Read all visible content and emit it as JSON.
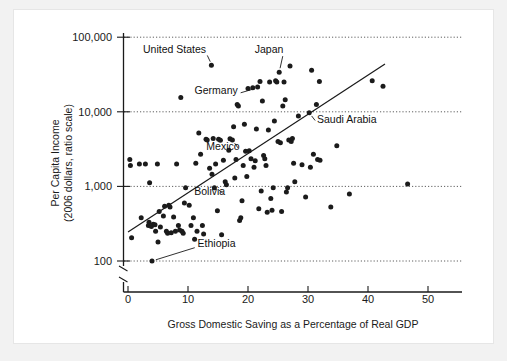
{
  "chart_data": {
    "type": "scatter",
    "title": "",
    "xlabel": "Gross Domestic Saving as a Percentage of Real GDP",
    "ylabel_line1": "Per Capita Income",
    "ylabel_line2": "(2006 dollars, ratio scale)",
    "yscale": "log",
    "xscale": "linear",
    "xlim": [
      0,
      56
    ],
    "ylim": [
      100,
      100000
    ],
    "grid": "horizontal-dotted-at-decades",
    "legend": "none",
    "axis_break": true,
    "xticks": [
      0,
      10,
      20,
      30,
      40,
      50
    ],
    "xtick_labels": [
      "0",
      "10",
      "20",
      "30",
      "40",
      "50"
    ],
    "yticks": [
      100,
      1000,
      10000,
      100000
    ],
    "ytick_labels": [
      "100",
      "1,000",
      "10,000",
      "100,000"
    ],
    "trend_line": {
      "x_start": 0.0,
      "y_start": 320,
      "x_end": 42.8,
      "y_end": 46000
    },
    "annotations": [
      {
        "label": "United States",
        "text_x": 13.0,
        "text_y": 62000,
        "point_x": 14.0,
        "point_y": 42000
      },
      {
        "label": "Japan",
        "text_x": 25.9,
        "text_y": 61000,
        "point_x": 25.2,
        "point_y": 34000
      },
      {
        "label": "Germany",
        "text_x": 18.3,
        "text_y": 17500,
        "point_x": 21.6,
        "point_y": 21000
      },
      {
        "label": "Mexico",
        "text_x": 18.6,
        "text_y": 3050,
        "point_x": 17.4,
        "point_y": 4200
      },
      {
        "label": "Saudi Arabia",
        "text_x": 31.5,
        "text_y": 7100,
        "point_x": 30.2,
        "point_y": 9700
      },
      {
        "label": "Bolivia",
        "text_x": 16.2,
        "text_y": 770,
        "point_x": 14.6,
        "point_y": 960
      },
      {
        "label": "Ethiopia",
        "text_x": 11.6,
        "text_y": 155,
        "point_x": 4.0,
        "point_y": 100
      }
    ],
    "points": [
      [
        0.3,
        2300
      ],
      [
        0.4,
        1900
      ],
      [
        0.6,
        205
      ],
      [
        1.9,
        2000
      ],
      [
        2.2,
        380
      ],
      [
        2.9,
        2000
      ],
      [
        3.4,
        300
      ],
      [
        3.5,
        330
      ],
      [
        3.6,
        1120
      ],
      [
        3.9,
        290
      ],
      [
        4.0,
        100
      ],
      [
        4.2,
        310
      ],
      [
        4.5,
        305
      ],
      [
        4.6,
        250
      ],
      [
        4.9,
        2000
      ],
      [
        5.0,
        180
      ],
      [
        5.2,
        460
      ],
      [
        5.4,
        285
      ],
      [
        5.9,
        400
      ],
      [
        6.1,
        540
      ],
      [
        6.4,
        250
      ],
      [
        6.6,
        235
      ],
      [
        6.8,
        560
      ],
      [
        7.0,
        530
      ],
      [
        7.2,
        240
      ],
      [
        7.6,
        390
      ],
      [
        7.9,
        250
      ],
      [
        8.1,
        2000
      ],
      [
        8.4,
        300
      ],
      [
        8.6,
        260
      ],
      [
        8.8,
        15500
      ],
      [
        9.0,
        250
      ],
      [
        9.2,
        235
      ],
      [
        9.4,
        600
      ],
      [
        9.6,
        960
      ],
      [
        10.2,
        560
      ],
      [
        10.5,
        300
      ],
      [
        10.9,
        380
      ],
      [
        11.1,
        195
      ],
      [
        11.3,
        2050
      ],
      [
        11.5,
        250
      ],
      [
        11.8,
        5200
      ],
      [
        12.1,
        2700
      ],
      [
        12.4,
        300
      ],
      [
        12.6,
        230
      ],
      [
        13.0,
        4300
      ],
      [
        13.2,
        4200
      ],
      [
        13.6,
        1750
      ],
      [
        13.9,
        42000
      ],
      [
        14.0,
        1450
      ],
      [
        14.2,
        4400
      ],
      [
        14.4,
        960
      ],
      [
        14.6,
        2000
      ],
      [
        14.9,
        470
      ],
      [
        15.1,
        4300
      ],
      [
        15.4,
        4150
      ],
      [
        15.6,
        225
      ],
      [
        15.9,
        2250
      ],
      [
        16.2,
        1150
      ],
      [
        16.4,
        1050
      ],
      [
        16.8,
        3050
      ],
      [
        17.0,
        4350
      ],
      [
        17.4,
        4200
      ],
      [
        17.6,
        6300
      ],
      [
        17.8,
        1300
      ],
      [
        18.0,
        2300
      ],
      [
        18.2,
        12500
      ],
      [
        18.4,
        12000
      ],
      [
        18.6,
        350
      ],
      [
        18.8,
        380
      ],
      [
        19.0,
        640
      ],
      [
        19.2,
        1900
      ],
      [
        19.4,
        6800
      ],
      [
        19.6,
        2950
      ],
      [
        19.8,
        1360
      ],
      [
        20.0,
        20500
      ],
      [
        20.2,
        3000
      ],
      [
        20.5,
        2350
      ],
      [
        20.8,
        21000
      ],
      [
        21.0,
        1800
      ],
      [
        21.2,
        2200
      ],
      [
        21.4,
        5900
      ],
      [
        21.6,
        21500
      ],
      [
        21.8,
        500
      ],
      [
        22.0,
        25500
      ],
      [
        22.2,
        870
      ],
      [
        22.4,
        14000
      ],
      [
        22.6,
        2600
      ],
      [
        22.8,
        2350
      ],
      [
        23.0,
        1900
      ],
      [
        23.2,
        450
      ],
      [
        23.4,
        5700
      ],
      [
        23.6,
        25000
      ],
      [
        23.8,
        690
      ],
      [
        24.0,
        480
      ],
      [
        24.2,
        960
      ],
      [
        24.4,
        7500
      ],
      [
        24.6,
        26000
      ],
      [
        24.8,
        25000
      ],
      [
        25.0,
        4000
      ],
      [
        25.2,
        34000
      ],
      [
        25.4,
        3850
      ],
      [
        25.6,
        460
      ],
      [
        25.8,
        12000
      ],
      [
        26.0,
        25000
      ],
      [
        26.2,
        14500
      ],
      [
        26.4,
        840
      ],
      [
        26.6,
        960
      ],
      [
        26.8,
        4200
      ],
      [
        27.0,
        41000
      ],
      [
        27.2,
        4000
      ],
      [
        27.4,
        4400
      ],
      [
        27.6,
        2050
      ],
      [
        27.8,
        1150
      ],
      [
        28.4,
        8800
      ],
      [
        29.0,
        1950
      ],
      [
        29.6,
        720
      ],
      [
        30.2,
        9700
      ],
      [
        30.4,
        1800
      ],
      [
        30.6,
        36000
      ],
      [
        30.9,
        2700
      ],
      [
        31.4,
        12500
      ],
      [
        31.6,
        2300
      ],
      [
        31.9,
        25500
      ],
      [
        32.0,
        2250
      ],
      [
        33.8,
        530
      ],
      [
        34.8,
        3500
      ],
      [
        36.9,
        790
      ],
      [
        40.7,
        26000
      ],
      [
        42.5,
        22000
      ],
      [
        46.6,
        1080
      ]
    ]
  },
  "axis_labels": {
    "x_tick_0": "0",
    "x_tick_1": "10",
    "x_tick_2": "20",
    "x_tick_3": "30",
    "x_tick_4": "40",
    "x_tick_5": "50",
    "y_tick_0": "100",
    "y_tick_1": "1,000",
    "y_tick_2": "10,000",
    "y_tick_3": "100,000"
  },
  "colors": {
    "point": "#1b1b1b",
    "axis": "#1a1a1a",
    "grid": "#4d4d4d",
    "panel": "#ffffff",
    "page": "#f2f2f2"
  }
}
